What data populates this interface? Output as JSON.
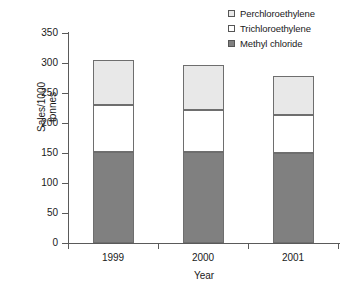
{
  "chart_data": {
    "type": "bar",
    "subtype": "stacked-vertical",
    "title": "",
    "xlabel": "Year",
    "ylabel": "Sales/1000 tonnes",
    "ylabel_lines": [
      "Sales/1000",
      "tonnes"
    ],
    "categories": [
      "1999",
      "2000",
      "2001"
    ],
    "ylim": [
      0,
      350
    ],
    "yticks": [
      0,
      50,
      100,
      150,
      200,
      250,
      300,
      350
    ],
    "ytick_labels": [
      "0",
      "50",
      "100",
      "150",
      "200",
      "250",
      "300",
      "350"
    ],
    "grid": false,
    "legend_position": "top-right",
    "series": [
      {
        "name": "Methyl chloride",
        "color": "#808080",
        "stack_order": 0,
        "values": [
          152,
          152,
          150
        ]
      },
      {
        "name": "Trichloroethylene",
        "color": "#ffffff",
        "stack_order": 1,
        "values": [
          78,
          70,
          63
        ]
      },
      {
        "name": "Perchloroethylene",
        "color": "#e8e8e8",
        "stack_order": 2,
        "values": [
          75,
          75,
          65
        ]
      }
    ],
    "cumulative_tops": {
      "1999": [
        152,
        230,
        305
      ],
      "2000": [
        152,
        222,
        297
      ],
      "2001": [
        150,
        213,
        278
      ]
    },
    "totals": [
      305,
      297,
      278
    ]
  },
  "legend": {
    "entries": [
      {
        "label": "Perchloroethylene",
        "color": "#e8e8e8"
      },
      {
        "label": "Trichloroethylene",
        "color": "#ffffff"
      },
      {
        "label": "Methyl chloride",
        "color": "#808080"
      }
    ]
  },
  "colors": {
    "axis": "#5a5a5a",
    "bar_outline": "#6e6e6e",
    "text": "#1a1a1a",
    "background": "#ffffff"
  }
}
